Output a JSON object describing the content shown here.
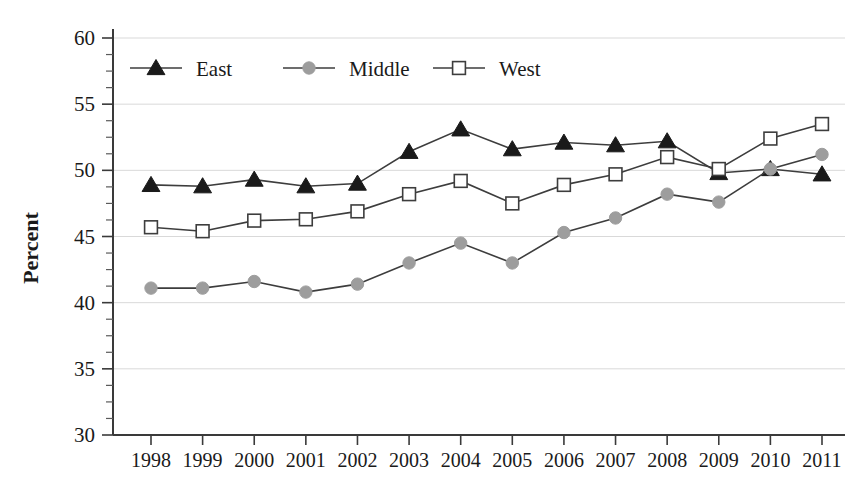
{
  "chart_data": {
    "type": "line",
    "title": "",
    "xlabel": "",
    "ylabel": "Percent",
    "ylim": [
      30,
      60
    ],
    "ytick_step": 5,
    "yticks": [
      30,
      35,
      40,
      45,
      50,
      55,
      60
    ],
    "grid": true,
    "legend_position": "top-inside",
    "categories": [
      "1998",
      "1999",
      "2000",
      "2001",
      "2002",
      "2003",
      "2004",
      "2005",
      "2006",
      "2007",
      "2008",
      "2009",
      "2010",
      "2011"
    ],
    "series": [
      {
        "name": "East",
        "marker": "filled-triangle",
        "color": "#1a1a1a",
        "values": [
          48.9,
          48.8,
          49.3,
          48.8,
          49.0,
          51.4,
          53.1,
          51.6,
          52.1,
          51.9,
          52.2,
          49.8,
          50.1,
          49.7
        ]
      },
      {
        "name": "Middle",
        "marker": "filled-circle",
        "color": "#9d9d9d",
        "values": [
          41.1,
          41.1,
          41.6,
          40.8,
          41.4,
          43.0,
          44.5,
          43.0,
          45.3,
          46.4,
          48.2,
          47.6,
          50.1,
          51.2
        ]
      },
      {
        "name": "West",
        "marker": "open-square",
        "color": "#ffffff",
        "values": [
          45.7,
          45.4,
          46.2,
          46.3,
          46.9,
          48.2,
          49.2,
          47.5,
          48.9,
          49.7,
          51.0,
          50.1,
          52.4,
          53.5
        ]
      }
    ]
  },
  "axis": {
    "y_title": "Percent",
    "y_tick_labels": [
      "60",
      "55",
      "50",
      "45",
      "40",
      "35",
      "30"
    ],
    "x_tick_labels": [
      "1998",
      "1999",
      "2000",
      "2001",
      "2002",
      "2003",
      "2004",
      "2005",
      "2006",
      "2007",
      "2008",
      "2009",
      "2010",
      "2011"
    ]
  },
  "legend": {
    "entries": [
      {
        "label": "East",
        "marker": "filled-triangle"
      },
      {
        "label": "Middle",
        "marker": "filled-circle"
      },
      {
        "label": "West",
        "marker": "open-square"
      }
    ]
  },
  "colors": {
    "east_marker": "#1a1a1a",
    "middle_marker": "#9d9d9d",
    "west_marker_fill": "#ffffff",
    "line": "#3d3d3d",
    "gridline": "#d9d9d9",
    "axis": "#3a3a3a",
    "text": "#1a1a1a",
    "background": "#ffffff"
  }
}
